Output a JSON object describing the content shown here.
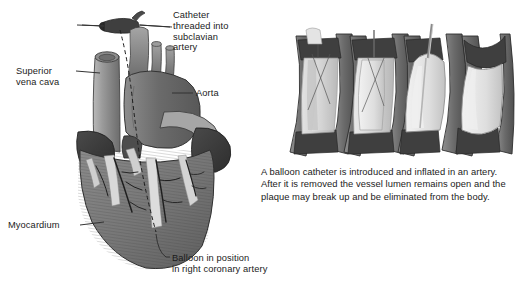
{
  "figure": {
    "style": "grayscale medical illustration",
    "background_color": "#ffffff"
  },
  "labels": {
    "catheter": "Catheter\nthreaded into\nsubclavian\nartery",
    "superior_vena_cava": "Superior\nvena cava",
    "aorta": "Aorta",
    "myocardium": "Myocardium",
    "balloon": "Balloon in position\nin right coronary artery"
  },
  "caption": {
    "text": "A balloon catheter is introduced and inflated in an artery. After it is removed the vessel lumen remains open and the plaque may break up and be eliminated from the body."
  },
  "panels": {
    "count": 4,
    "items": [
      {
        "stage": "1",
        "name": "deflated-balloon-in-narrowed-artery"
      },
      {
        "stage": "2",
        "name": "balloon-beginning-to-inflate"
      },
      {
        "stage": "3",
        "name": "balloon-fully-inflated-compressing-plaque"
      },
      {
        "stage": "4",
        "name": "catheter-removed-lumen-open"
      }
    ]
  },
  "colors": {
    "vessel_wall_dark": "#4a4a4a",
    "vessel_wall_mid": "#7d7d7d",
    "plaque_light": "#d9d9d9",
    "balloon_light": "#e8e8e8",
    "heart_muscle": "#7a7a7a",
    "heart_dark": "#3a3a3a",
    "aorta_gray": "#6e6e6e",
    "vena_cava_gray": "#9a9a9a",
    "fat_light": "#dcdcdc",
    "outline": "#2a2a2a",
    "text": "#1b1b1b",
    "leader_line": "#3a3a3a"
  }
}
